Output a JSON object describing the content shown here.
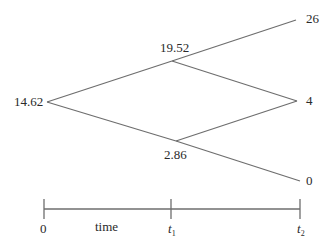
{
  "diagram": {
    "type": "binomial-tree",
    "colors": {
      "line": "#6e6e6e",
      "text": "#2a2a2a"
    },
    "nodes": {
      "root": {
        "label": "14.62"
      },
      "up": {
        "label": "19.52"
      },
      "down": {
        "label": "2.86"
      },
      "uu": {
        "label": "26"
      },
      "ud": {
        "label": "4"
      },
      "dd": {
        "label": "0"
      }
    },
    "timeline": {
      "axis_label": "time",
      "ticks": [
        {
          "label": "0"
        },
        {
          "label": "t",
          "subscript": "1"
        },
        {
          "label": "t",
          "subscript": "2"
        }
      ]
    }
  }
}
